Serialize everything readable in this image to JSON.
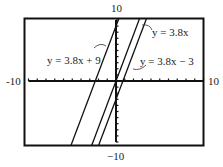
{
  "chart_data": {
    "type": "line",
    "title": "",
    "xlabel": "",
    "ylabel": "",
    "xlim": [
      -10,
      10
    ],
    "ylim": [
      -10,
      10
    ],
    "grid": false,
    "axis_tick_labels": {
      "top": "10",
      "bottom": "-10",
      "left": "-10",
      "right": "10"
    },
    "ticks_every": 1,
    "series": [
      {
        "name": "y = 3.8x + 9",
        "slope": 3.8,
        "intercept": 9
      },
      {
        "name": "y = 3.8x",
        "slope": 3.8,
        "intercept": 0
      },
      {
        "name": "y = 3.8x - 3",
        "slope": 3.8,
        "intercept": -3
      }
    ],
    "annotations": [
      {
        "text": "y = 3.8x + 9",
        "points_to": "y = 3.8x + 9"
      },
      {
        "text": "y = 3.8x",
        "points_to": "y = 3.8x"
      },
      {
        "text": "y = 3.8x − 3",
        "points_to": "y = 3.8x - 3"
      }
    ]
  },
  "labels": {
    "top": "10",
    "bottom": "−10",
    "left": "-10",
    "right": "10",
    "line1": "y = 3.8x + 9",
    "line2": "y = 3.8x",
    "line3": "y = 3.8x − 3"
  },
  "colors": {
    "frame": "#111111",
    "line": "#111111",
    "text": "#222222"
  }
}
